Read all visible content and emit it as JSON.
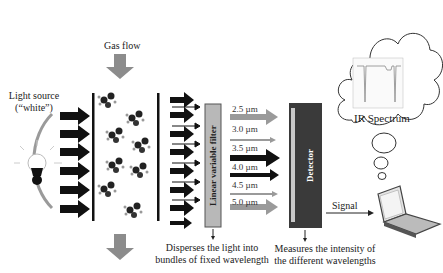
{
  "labels": {
    "gas_flow": "Gas flow",
    "light_source": "Light source",
    "light_source_sub": "(“white”)",
    "filter": "Linear variable filter",
    "detector": "Detector",
    "ir_spectrum": "IR Spectrum",
    "signal": "Signal",
    "filter_caption_1": "Disperses the light into",
    "filter_caption_2": "bundles of fixed wavelength",
    "detector_caption_1": "Measures the intensity of",
    "detector_caption_2": "the different wavelengths"
  },
  "wavelengths": [
    {
      "label": "2.5 µm",
      "color": "#9a9a9a",
      "weight": "thick"
    },
    {
      "label": "3.0 µm",
      "color": "#9a9a9a",
      "weight": "thin"
    },
    {
      "label": "3.5 µm",
      "color": "#111111",
      "weight": "thick"
    },
    {
      "label": "4.0 µm",
      "color": "#111111",
      "weight": "medium"
    },
    {
      "label": "4.5 µm",
      "color": "#9a9a9a",
      "weight": "thin"
    },
    {
      "label": "5.0 µm",
      "color": "#9a9a9a",
      "weight": "thick"
    }
  ],
  "colors": {
    "detector": "#3a3a3a",
    "filter": "#b8b8b8",
    "gray_arrow": "#8c8c8c",
    "black_arrow": "#111111"
  }
}
